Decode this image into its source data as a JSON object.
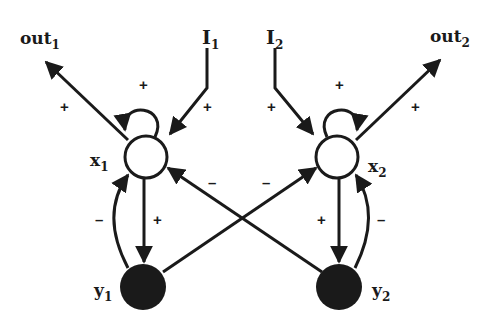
{
  "diagram": {
    "type": "neural-network",
    "nodes": [
      {
        "id": "x1",
        "label": "x",
        "sub": "1",
        "kind": "excitatory",
        "fill": "#ffffff"
      },
      {
        "id": "x2",
        "label": "x",
        "sub": "2",
        "kind": "excitatory",
        "fill": "#ffffff"
      },
      {
        "id": "y1",
        "label": "y",
        "sub": "1",
        "kind": "inhibitory",
        "fill": "#1a1a1a"
      },
      {
        "id": "y2",
        "label": "y",
        "sub": "2",
        "kind": "inhibitory",
        "fill": "#1a1a1a"
      }
    ],
    "inputs": [
      {
        "id": "I1",
        "label": "I",
        "sub": "1"
      },
      {
        "id": "I2",
        "label": "I",
        "sub": "2"
      }
    ],
    "outputs": [
      {
        "id": "out1",
        "label": "out",
        "sub": "1"
      },
      {
        "id": "out2",
        "label": "out",
        "sub": "2"
      }
    ],
    "edges": [
      {
        "from": "x1",
        "to": "out1",
        "sign": "+"
      },
      {
        "from": "I1",
        "to": "x1",
        "sign": "+"
      },
      {
        "from": "x1",
        "to": "x1",
        "sign": "+"
      },
      {
        "from": "x1",
        "to": "y1",
        "sign": "+"
      },
      {
        "from": "y1",
        "to": "x1",
        "sign": "–"
      },
      {
        "from": "y2",
        "to": "x1",
        "sign": "–"
      },
      {
        "from": "x2",
        "to": "out2",
        "sign": "+"
      },
      {
        "from": "I2",
        "to": "x2",
        "sign": "+"
      },
      {
        "from": "x2",
        "to": "x2",
        "sign": "+"
      },
      {
        "from": "x2",
        "to": "y2",
        "sign": "+"
      },
      {
        "from": "y2",
        "to": "x2",
        "sign": "–"
      },
      {
        "from": "y1",
        "to": "x2",
        "sign": "–"
      }
    ]
  }
}
